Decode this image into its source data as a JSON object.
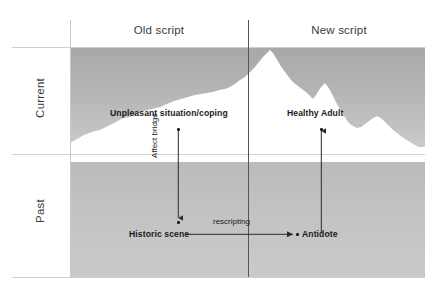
{
  "diagram": {
    "columns": [
      {
        "id": "old",
        "label": "Old script"
      },
      {
        "id": "new",
        "label": "New script"
      }
    ],
    "rows": [
      {
        "id": "current",
        "label": "Current"
      },
      {
        "id": "past",
        "label": "Past"
      }
    ],
    "nodes": [
      {
        "id": "unpleasant",
        "label": "Unpleasant situation/coping",
        "quadrant": "old-current"
      },
      {
        "id": "healthy",
        "label": "Healthy Adult",
        "quadrant": "new-current"
      },
      {
        "id": "historic",
        "label": "Historic scene",
        "quadrant": "old-past"
      },
      {
        "id": "antidote",
        "label": "Antidote",
        "quadrant": "new-past"
      }
    ],
    "edges": [
      {
        "id": "affect-bridge",
        "label": "Affect bridge",
        "from": "unpleasant",
        "to": "historic",
        "direction": "down",
        "orientation": "vertical"
      },
      {
        "id": "rescripting",
        "label": "rescripting",
        "from": "historic",
        "to": "antidote",
        "direction": "right",
        "orientation": "horizontal"
      },
      {
        "id": "antidote-up",
        "label": "",
        "from": "antidote",
        "to": "healthy",
        "direction": "up",
        "orientation": "vertical"
      }
    ],
    "illustration": {
      "name": "iceberg",
      "waterline_label": "",
      "above_water_color": "#ffffff",
      "below_water_color": "#f2f2f2"
    },
    "colors": {
      "background": "#ffffff",
      "sea_upper": "#b0b0b0",
      "sea_lower": "#c2c2c2",
      "iceberg": "#ffffff",
      "divider": "#555555",
      "gridline": "#cfcfcf",
      "text": "#3a3a3a",
      "node_text": "#1a1a1a"
    }
  }
}
